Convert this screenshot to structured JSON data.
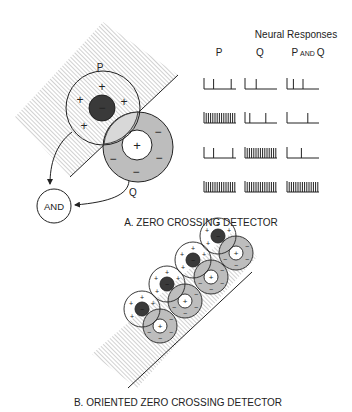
{
  "panel_a": {
    "caption": "A.  ZERO CROSSING DETECTOR",
    "label_p": "P",
    "label_q": "Q",
    "and_gate": "AND",
    "p_center_sign": "−",
    "p_surround_sign": "+",
    "q_center_sign": "+",
    "q_surround_sign": "−"
  },
  "neural_responses": {
    "title": "Neural Responses",
    "columns": [
      "P",
      "Q",
      "P AND Q"
    ],
    "col_p": "P",
    "col_q": "Q",
    "col_pq_p": "P",
    "col_pq_and": "AND",
    "col_pq_q": "Q",
    "rows": [
      {
        "P": "sparse",
        "Q": "sparse",
        "P_AND_Q": "sparse"
      },
      {
        "P": "dense",
        "Q": "sparse",
        "P_AND_Q": "sparse"
      },
      {
        "P": "sparse",
        "Q": "dense",
        "P_AND_Q": "sparse"
      },
      {
        "P": "dense",
        "Q": "dense",
        "P_AND_Q": "dense"
      }
    ]
  },
  "panel_b": {
    "caption": "B.  ORIENTED ZERO CROSSING DETECTOR"
  },
  "colors": {
    "dark_center": "#3a3a3a",
    "gray_surround": "#bdbdbd",
    "hatch": "#9a9a9a",
    "stroke": "#222222"
  }
}
